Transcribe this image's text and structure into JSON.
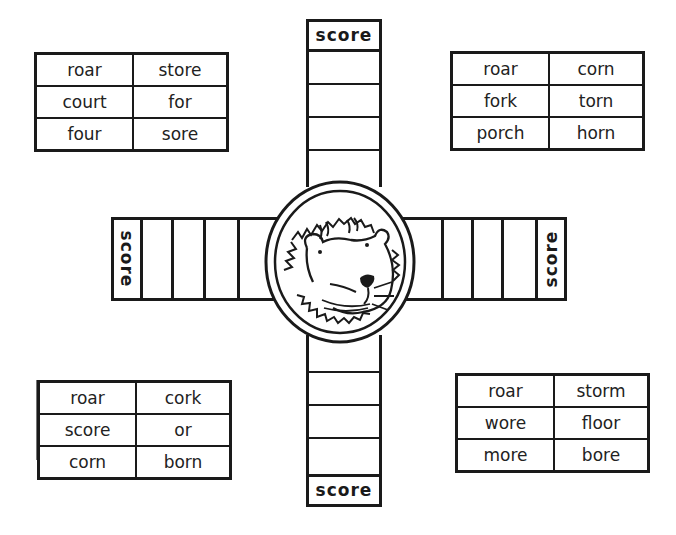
{
  "game": {
    "score_label": "score",
    "center_image": "lion-face",
    "tables": {
      "top_left": {
        "rows": [
          [
            "roar",
            "store"
          ],
          [
            "court",
            "for"
          ],
          [
            "four",
            "sore"
          ]
        ]
      },
      "top_right": {
        "rows": [
          [
            "roar",
            "corn"
          ],
          [
            "fork",
            "torn"
          ],
          [
            "porch",
            "horn"
          ]
        ]
      },
      "bottom_left": {
        "rows": [
          [
            "roar",
            "cork"
          ],
          [
            "score",
            "or"
          ],
          [
            "corn",
            "born"
          ]
        ]
      },
      "bottom_right": {
        "rows": [
          [
            "roar",
            "storm"
          ],
          [
            "wore",
            "floor"
          ],
          [
            "more",
            "bore"
          ]
        ]
      }
    },
    "arms": {
      "top": {
        "score_label": "score",
        "cells": 4
      },
      "bottom": {
        "score_label": "score",
        "cells": 4
      },
      "left": {
        "score_label": "score",
        "cells": 4
      },
      "right": {
        "score_label": "score",
        "cells": 4
      }
    },
    "colors": {
      "ink": "#1a1a1a",
      "paper": "#ffffff"
    }
  }
}
